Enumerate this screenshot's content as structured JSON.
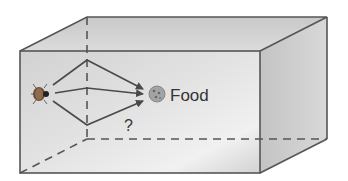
{
  "diagram": {
    "food_label": "Food",
    "question_mark": "?",
    "colors": {
      "box_edge": "#555555",
      "box_fill": "#d4d4d4",
      "arrow": "#4a4a4a",
      "food": "#999999"
    },
    "elements": [
      "insect",
      "three paths to food",
      "food",
      "transparent box"
    ]
  }
}
